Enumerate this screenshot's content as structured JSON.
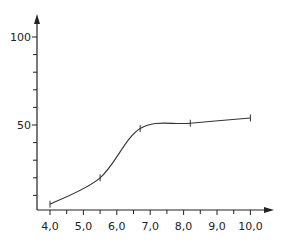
{
  "chart_data": {
    "type": "line",
    "title": "",
    "xlabel": "",
    "ylabel": "",
    "x_ticks": [
      "4,0",
      "5,0",
      "6,0",
      "7,0",
      "8,0",
      "9,0",
      "10,0"
    ],
    "x_tick_values": [
      4,
      5,
      6,
      7,
      8,
      9,
      10
    ],
    "y_ticks_labeled": [
      "50",
      "100"
    ],
    "y_tick_values_labeled": [
      50,
      100
    ],
    "y_minor_ticks": [
      10,
      20,
      30,
      40,
      60,
      70,
      80,
      90
    ],
    "xlim": [
      3.6,
      10.8
    ],
    "ylim": [
      0,
      110
    ],
    "grid": false,
    "legend": null,
    "series": [
      {
        "name": "curve",
        "x": [
          4.0,
          5.5,
          6.7,
          8.2,
          10.0
        ],
        "values": [
          5,
          20,
          48,
          51,
          54
        ],
        "markers": "vertical-tick"
      }
    ],
    "note": "values estimated from axis scale; no data labels in figure"
  }
}
